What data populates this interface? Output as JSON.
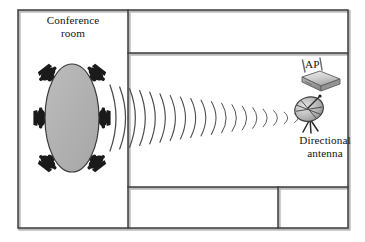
{
  "figure": {
    "type": "floor-plan-diagram"
  },
  "labels": {
    "conference_room": "Conference\nroom",
    "ap": "AP",
    "directional_antenna": "Directional\nantenna"
  },
  "colors": {
    "wall_stroke": "#3c3c3c",
    "wall_shadow": "#b9b9b9",
    "table_fill": "#b0b0b0",
    "table_stroke": "#3a3a3a",
    "chair_fill": "#1a1a1a",
    "wave_stroke": "#4a4a4a",
    "device_light": "#d8d8d8",
    "device_mid": "#a8a8a8",
    "device_dark": "#6a6a6a",
    "text": "#141414",
    "background": "#ffffff"
  },
  "floorplan": {
    "outer_room": {
      "x": 18,
      "y": 10,
      "width": 330,
      "height": 218
    },
    "walls": [
      {
        "name": "vertical-conference-wall",
        "x1": 128,
        "y1": 10,
        "x2": 128,
        "y2": 228
      },
      {
        "name": "horizontal-upper-wall",
        "x1": 128,
        "y1": 53,
        "x2": 348,
        "y2": 53
      },
      {
        "name": "horizontal-lower-wall",
        "x1": 128,
        "y1": 187,
        "x2": 348,
        "y2": 187
      },
      {
        "name": "vertical-lower-right-wall",
        "x1": 278,
        "y1": 187,
        "x2": 278,
        "y2": 228
      }
    ]
  },
  "conference_table": {
    "shape": "oval",
    "cx": 72,
    "cy": 118,
    "rx": 27,
    "ry": 54
  },
  "chairs": {
    "count": 6,
    "positions": [
      {
        "name": "chair-top-left",
        "x": 47,
        "y": 76
      },
      {
        "name": "chair-top-right",
        "x": 97,
        "y": 76
      },
      {
        "name": "chair-mid-left",
        "x": 41,
        "y": 118
      },
      {
        "name": "chair-mid-right",
        "x": 103,
        "y": 118
      },
      {
        "name": "chair-bottom-left",
        "x": 47,
        "y": 160
      },
      {
        "name": "chair-bottom-right",
        "x": 97,
        "y": 160
      }
    ]
  },
  "wave_beam": {
    "name": "radio-wave-arcs",
    "arc_count": 20,
    "origin_x": 110,
    "origin_y": 118,
    "target_x": 305,
    "target_y": 118,
    "start_half_height": 33,
    "end_half_height": 3
  },
  "devices": [
    {
      "name": "access-point",
      "label": "AP",
      "type": "wireless-access-point",
      "x": 300,
      "y": 70,
      "antenna_count": 2
    },
    {
      "name": "directional-antenna",
      "label": "Directional antenna",
      "type": "parabolic-dish-on-tripod",
      "x": 308,
      "y": 106
    }
  ]
}
